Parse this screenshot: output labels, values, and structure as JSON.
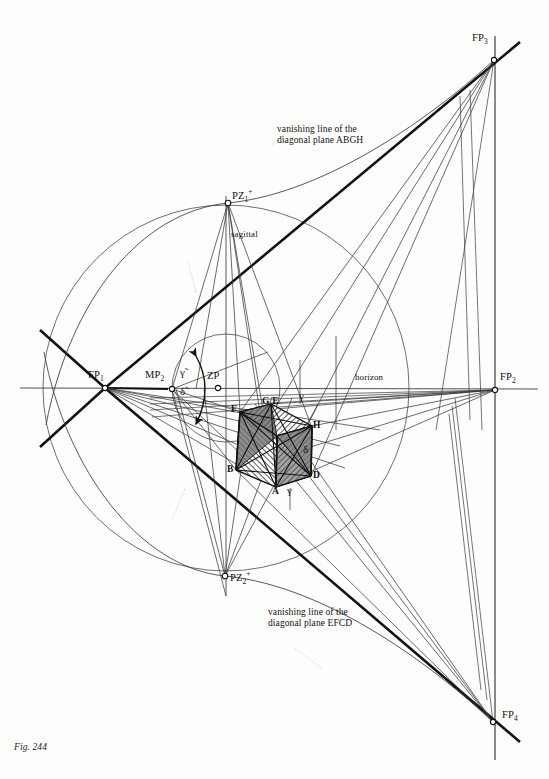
{
  "figure": {
    "caption": "Fig. 244",
    "domain": "technical perspective construction diagram"
  },
  "annotations": {
    "vanishing_line_top": "vanishing line of the\ndiagonal plane ABGH",
    "vanishing_line_top_line1": "vanishing line of the",
    "vanishing_line_top_line2": "diagonal plane ABGH",
    "vanishing_line_bottom_line1": "vanishing line of the",
    "vanishing_line_bottom_line2": "diagonal plane EFCD",
    "horizon": "horizon",
    "sagittal": "sagittal"
  },
  "points": [
    {
      "id": "FP1",
      "label": "FP",
      "sub": "1",
      "x": 105,
      "y": 388,
      "label_x": 88,
      "label_y": 372
    },
    {
      "id": "FP2",
      "label": "FP",
      "sub": "2",
      "x": 495,
      "y": 390,
      "label_x": 500,
      "label_y": 374
    },
    {
      "id": "FP3",
      "label": "FP",
      "sub": "3",
      "x": 494,
      "y": 60,
      "label_x": 476,
      "label_y": 34
    },
    {
      "id": "FP4",
      "label": "FP",
      "sub": "4",
      "x": 493,
      "y": 722,
      "label_x": 502,
      "label_y": 710
    },
    {
      "id": "MP2",
      "label": "MP",
      "sub": "2",
      "x": 172,
      "y": 388,
      "label_x": 146,
      "label_y": 372
    },
    {
      "id": "ZP",
      "label": "ZP",
      "sub": "",
      "x": 218,
      "y": 388,
      "label_x": 208,
      "label_y": 372
    },
    {
      "id": "PZ1",
      "label": "PZ",
      "sub": "1",
      "sup": "+",
      "x": 228,
      "y": 203,
      "label_x": 232,
      "label_y": 190
    },
    {
      "id": "PZ2",
      "label": "PZ",
      "sub": "2",
      "sup": "+",
      "x": 225,
      "y": 576,
      "label_x": 230,
      "label_y": 573
    }
  ],
  "angles": [
    {
      "id": "gamma-tilde",
      "glyph": "γ̃",
      "x": 185,
      "y": 372
    },
    {
      "id": "delta-tilde",
      "glyph": "δ̃",
      "x": 184,
      "y": 388
    },
    {
      "id": "gamma-top",
      "glyph": "γ",
      "x": 304,
      "y": 396
    },
    {
      "id": "gamma-bot",
      "glyph": "γ",
      "x": 290,
      "y": 484
    },
    {
      "id": "delta-right",
      "glyph": "δ",
      "x": 304,
      "y": 450
    }
  ],
  "cube_vertices": [
    {
      "id": "F",
      "label": "F",
      "x": 240,
      "y": 412
    },
    {
      "id": "G/E",
      "label": "G/E",
      "x": 271,
      "y": 404
    },
    {
      "id": "H",
      "label": "H",
      "x": 312,
      "y": 426
    },
    {
      "id": "B",
      "label": "B",
      "x": 236,
      "y": 470
    },
    {
      "id": "A",
      "label": "A",
      "x": 276,
      "y": 487
    },
    {
      "id": "D",
      "label": "D",
      "x": 311,
      "y": 476
    }
  ],
  "colors": {
    "ink": "#1a1a1a",
    "thin_line": "#3a3a3a",
    "hatch": "#2b2b2b",
    "shade_dark": "#6d6d6d",
    "paper": "#fdfdfc"
  },
  "geometry": {
    "horizon_y": 388,
    "vertical_FP2_x": 495,
    "vertical_sagittal_x": 226,
    "big_circle": {
      "cx": 226,
      "cy": 388,
      "r": 183
    },
    "small_circle": {
      "cx": 226,
      "cy": 388,
      "r": 54
    }
  }
}
